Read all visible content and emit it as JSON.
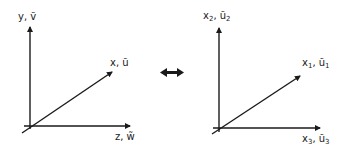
{
  "left_frame": {
    "vertical_axis_label": "y, ṽ",
    "diagonal_axis_label": "x, ũ",
    "horizontal_axis_label": "z, w̃"
  },
  "equivalence_symbol": "double-arrow",
  "right_frame": {
    "vertical_axis": {
      "base": "x",
      "sub": "2",
      "tilde_base": "ũ",
      "tilde_sub": "2"
    },
    "diagonal_axis": {
      "base": "x",
      "sub": "1",
      "tilde_base": "ũ",
      "tilde_sub": "1"
    },
    "horizontal_axis": {
      "base": "x",
      "sub": "3",
      "tilde_base": "ũ",
      "tilde_sub": "3"
    }
  },
  "colors": {
    "line": "#1a1a1a"
  }
}
